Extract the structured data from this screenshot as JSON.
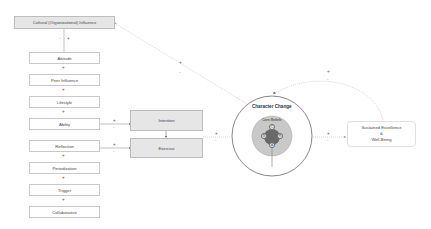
{
  "diagram": {
    "influence_box": {
      "label": "Cultural (Organizational) Influence",
      "links": [
        "-",
        "+"
      ]
    },
    "stack": [
      {
        "label": "Attitude"
      },
      {
        "label": "Peer Influence"
      },
      {
        "label": "Lifestyle"
      },
      {
        "label": "Ability"
      },
      {
        "label": "Reflection"
      },
      {
        "label": "Periodization"
      },
      {
        "label": "Trigger"
      },
      {
        "label": "Collaborative"
      }
    ],
    "stack_connectors": [
      "+",
      "+",
      "+",
      "+",
      "+",
      "+"
    ],
    "middle": {
      "intention": {
        "label": "Intention"
      },
      "exercise": {
        "label": "Exercise"
      }
    },
    "edge_signs": {
      "ability_to_intention": {
        "plus": "+",
        "minus": "-"
      },
      "reflection_to_exercise": {
        "plus": "+",
        "minus": "-"
      },
      "middle_to_character": {
        "plus": "+",
        "minus": "-"
      },
      "character_to_influence": {
        "plus": "+",
        "minus": "-"
      },
      "character_to_outcome": {
        "plus": "+",
        "minus": "-"
      },
      "outcome_feedback": {
        "plus": "+",
        "minus": "-"
      }
    },
    "character": {
      "title": "Character Change",
      "core_title": "Core Beliefs",
      "nodes": [
        "C",
        "B",
        "R",
        "A"
      ]
    },
    "outcome": {
      "line1": "Sustained Excellence",
      "line2": "&",
      "line3": "Well-Being"
    }
  }
}
